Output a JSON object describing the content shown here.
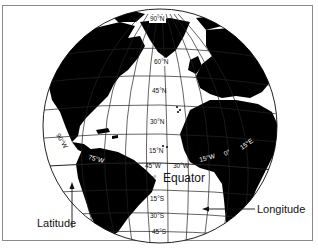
{
  "figure": {
    "type": "globe-diagram",
    "labels": {
      "equator": "Equator",
      "latitude": "Latitude",
      "longitude": "Longitude"
    },
    "latitude_ticks": [
      "90°N",
      "60°N",
      "45°N",
      "30°N",
      "15°N",
      "0°",
      "15°S",
      "30°S",
      "45°S"
    ],
    "longitude_ticks": [
      "90°W",
      "75°W",
      "60°W",
      "45°W",
      "30°W",
      "15°W",
      "0°",
      "15°E"
    ],
    "colors": {
      "land": "#000000",
      "ocean": "#ffffff",
      "grid": "#222222",
      "frame": "#8a8a8a"
    }
  }
}
